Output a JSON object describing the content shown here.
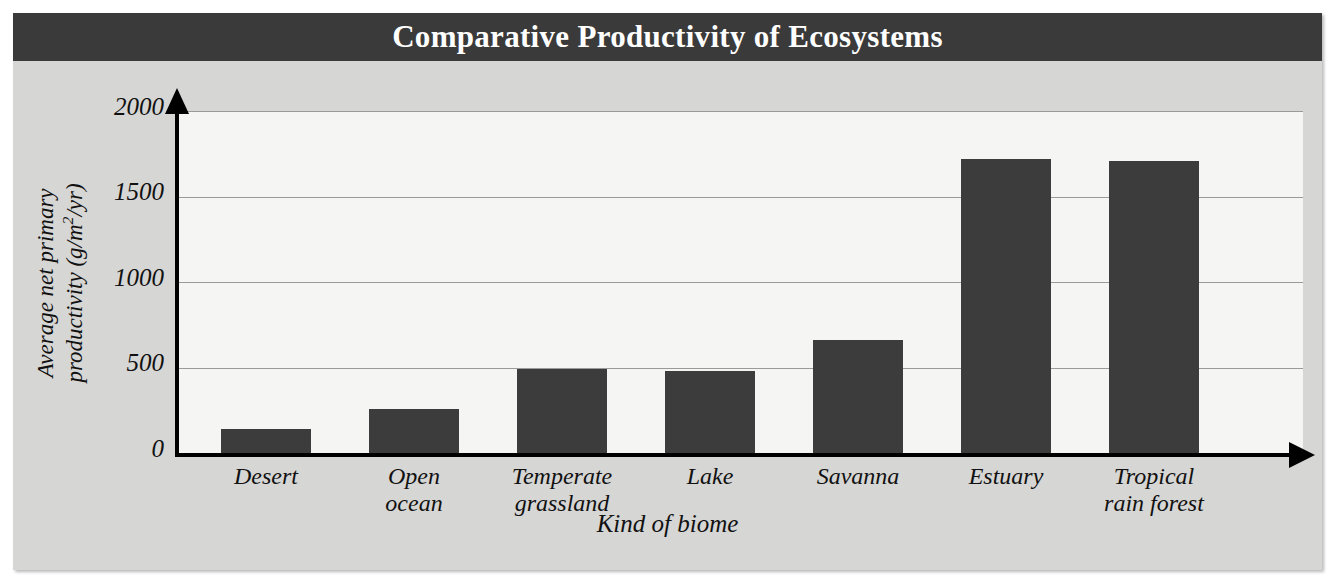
{
  "figure": {
    "title": "Comparative Productivity of Ecosystems",
    "banner_color": "#3a3a3a",
    "card_color": "#d6d6d4",
    "plot_bg_color": "#f5f5f3",
    "bar_color": "#3c3c3c"
  },
  "axes": {
    "ylabel_line1": "Average net primary",
    "ylabel_line2_pre": "productivity (g/m",
    "ylabel_line2_sup": "2",
    "ylabel_line2_post": "/yr)",
    "ylabel_full": "Average net primary productivity (g/m2/yr)",
    "xlabel": "Kind of biome",
    "yticks": [
      "0",
      "500",
      "1000",
      "1500",
      "2000"
    ]
  },
  "chart_data": {
    "type": "bar",
    "title": "Comparative Productivity of Ecosystems",
    "xlabel": "Kind of biome",
    "ylabel": "Average net primary productivity (g/m2/yr)",
    "categories": [
      "Desert",
      "Open ocean",
      "Temperate grassland",
      "Lake",
      "Savanna",
      "Estuary",
      "Tropical rain forest"
    ],
    "category_lines": [
      [
        "Desert"
      ],
      [
        "Open",
        "ocean"
      ],
      [
        "Temperate",
        "grassland"
      ],
      [
        "Lake"
      ],
      [
        "Savanna"
      ],
      [
        "Estuary"
      ],
      [
        "Tropical",
        "rain forest"
      ]
    ],
    "values": [
      140,
      260,
      490,
      480,
      660,
      1720,
      1710
    ],
    "ylim": [
      0,
      2000
    ],
    "yticks": [
      0,
      500,
      1000,
      1500,
      2000
    ],
    "grid": true,
    "legend": "none"
  }
}
